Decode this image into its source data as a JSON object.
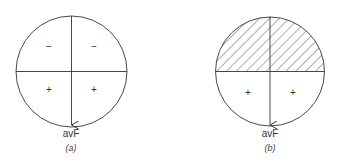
{
  "panels": [
    {
      "id": "a",
      "caption": "(a)",
      "axis_label": "avF",
      "quadrant_signs": {
        "upper_left": "−",
        "upper_right": "−",
        "lower_left": "+",
        "lower_right": "+"
      },
      "hatched_upper_half": false
    },
    {
      "id": "b",
      "caption": "(b)",
      "axis_label": "avF",
      "quadrant_signs": {
        "lower_left": "+",
        "lower_right": "+"
      },
      "hatched_upper_half": true
    }
  ],
  "colors": {
    "line": "#333333",
    "background": "#ffffff"
  }
}
